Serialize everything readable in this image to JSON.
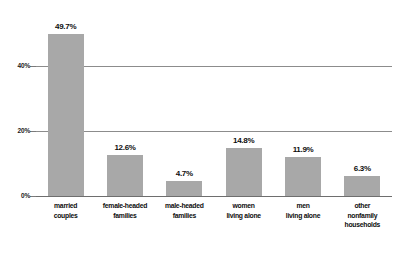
{
  "chart_data": {
    "type": "bar",
    "title": "",
    "subtitle": "",
    "xlabel": "",
    "ylabel": "",
    "categories": [
      "married couples",
      "female-headed families",
      "male-headed families",
      "women living alone",
      "men living alone",
      "other nonfamily households"
    ],
    "category_lines": [
      [
        "married",
        "couples"
      ],
      [
        "female-headed",
        "families"
      ],
      [
        "male-headed",
        "families"
      ],
      [
        "women",
        "living alone"
      ],
      [
        "men",
        "living alone"
      ],
      [
        "other",
        "nonfamily",
        "households"
      ]
    ],
    "values": [
      49.7,
      12.6,
      4.7,
      14.8,
      11.9,
      6.3
    ],
    "value_labels": [
      "49.7%",
      "12.6%",
      "4.7%",
      "14.8%",
      "11.9%",
      "6.3%"
    ],
    "ylim": [
      0,
      49.7
    ],
    "yticks": [
      0,
      20,
      40
    ],
    "ytick_labels": [
      "0%",
      "20%",
      "40%"
    ],
    "grid": true,
    "legend": false,
    "legend_position": "none",
    "bar_color": "#a8a8a8",
    "gridline_color": "#8c8c8c",
    "background_color": "#ffffff",
    "text_color": "#0d0d0d"
  }
}
